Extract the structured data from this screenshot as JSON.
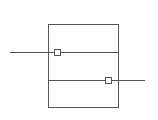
{
  "diagram": {
    "stroke_color": "#555555",
    "background": "#ffffff",
    "frame": {
      "x": 48,
      "y": 24,
      "width": 70,
      "height": 83
    },
    "divider_y": 80,
    "upper_divider_y": 52,
    "lines": [
      {
        "name": "input-line",
        "x1": 10,
        "y1": 52,
        "x2": 118,
        "y2": 52
      },
      {
        "name": "output-line",
        "x1": 48,
        "y1": 80,
        "x2": 145,
        "y2": 80
      }
    ],
    "ports": [
      {
        "name": "input-port",
        "x": 54,
        "y": 49,
        "size": 6
      },
      {
        "name": "output-port",
        "x": 105,
        "y": 77,
        "size": 6
      }
    ]
  }
}
